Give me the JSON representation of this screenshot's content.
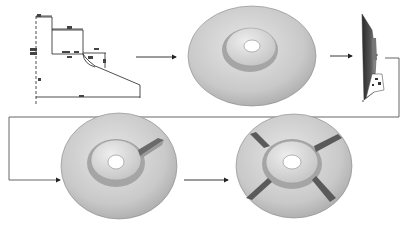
{
  "diagram": {
    "type": "process-flow",
    "stages": [
      {
        "id": "profile-sketch",
        "description": "2D cross-section profile sketch with dimensions"
      },
      {
        "id": "revolved-disc",
        "description": "Revolved disc with raised hub and center hole"
      },
      {
        "id": "side-section",
        "description": "Side view of the disc with detail callout"
      },
      {
        "id": "disc-one-rib",
        "description": "Disc with a single radial rib added"
      },
      {
        "id": "disc-four-ribs",
        "description": "Disc with four radial ribs (patterned)"
      }
    ],
    "flow": [
      "profile-sketch",
      "revolved-disc",
      "side-section",
      "disc-one-rib",
      "disc-four-ribs"
    ],
    "colors": {
      "line": "#222222",
      "connector": "#555555",
      "disc_light": "#d9d9d9",
      "disc_mid": "#bdbdbd",
      "disc_dark": "#8a8a8a",
      "rib_dark": "#555555"
    }
  }
}
